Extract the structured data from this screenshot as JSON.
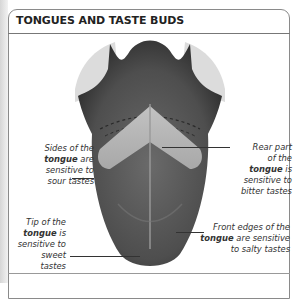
{
  "title": "TONGUES AND TASTE BUDS",
  "labels": {
    "sour": {
      "line1": "Sides of the",
      "line2_bold": "tongue",
      "line2_rest": " are",
      "line3": "sensitive to",
      "line4": "sour tastes"
    },
    "bitter": {
      "line1": "Rear part",
      "line2": "of the",
      "line3_bold": "tongue",
      "line3_rest": " is",
      "line4": "sensitive to",
      "line5": "bitter tastes"
    },
    "sweet": {
      "line1": "Tip of the",
      "line2_bold": "tongue",
      "line2_rest": " is",
      "line3": "sensitive to",
      "line4": "sweet tastes"
    },
    "salty": {
      "line1": "Front edges of the",
      "line2_bold": "tongue",
      "line2_rest": " are sensitive",
      "line3": "to salty tastes"
    }
  },
  "colors": {
    "tongue_dark": "#3a3a3a",
    "tongue_mid": "#5e5e5e",
    "bitter_zone": "#b4b4b4",
    "teeth": "#dedede",
    "frame": "#8a8a8a"
  }
}
